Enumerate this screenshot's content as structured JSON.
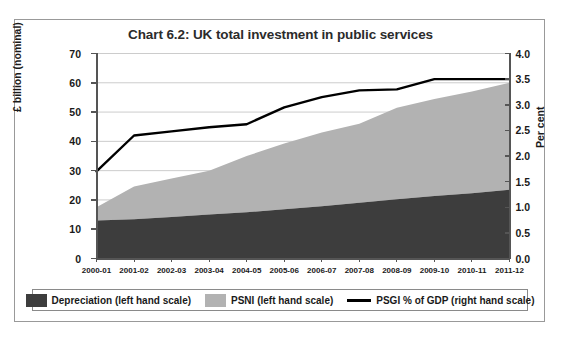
{
  "chart_data": {
    "type": "area",
    "title": "Chart 6.2: UK total investment in public services",
    "xlabel": "Years",
    "ylabel": "£ billion (nominal)",
    "ylabel_right": "Per cent",
    "categories": [
      "2000-01",
      "2001-02",
      "2002-03",
      "2003-04",
      "2004-05",
      "2005-06",
      "2006-07",
      "2007-08",
      "2008-09",
      "2009-10",
      "2010-11",
      "2011-12"
    ],
    "ylim": [
      0,
      70
    ],
    "yticks": [
      "0",
      "10",
      "20",
      "30",
      "40",
      "50",
      "60",
      "70"
    ],
    "ylim_right": [
      0,
      4.0
    ],
    "yticks_right": [
      "0.0",
      "0.5",
      "1.0",
      "1.5",
      "2.0",
      "2.5",
      "3.0",
      "3.5",
      "4.0"
    ],
    "grid": true,
    "legend_position": "bottom",
    "series": [
      {
        "name": "Depreciation (left hand scale)",
        "type": "area-stacked",
        "axis": "left",
        "color": "#3d3d3d",
        "values": [
          13.0,
          13.4,
          14.2,
          15.0,
          15.8,
          16.8,
          17.8,
          19.0,
          20.2,
          21.3,
          22.3,
          23.5
        ]
      },
      {
        "name": "PSNI (left hand scale)",
        "type": "area-stacked",
        "axis": "left",
        "color": "#b2b2b2",
        "values": [
          4.5,
          11.2,
          13.1,
          15.0,
          19.2,
          22.5,
          25.2,
          27.0,
          31.3,
          33.2,
          34.7,
          36.5
        ]
      },
      {
        "name": "PSGI % of GDP (right hand scale)",
        "type": "line",
        "axis": "right",
        "color": "#000000",
        "values": [
          1.7,
          2.4,
          2.48,
          2.56,
          2.62,
          2.95,
          3.15,
          3.28,
          3.3,
          3.5,
          3.5,
          3.5
        ]
      }
    ],
    "totals_left_scale": [
      17.5,
      24.6,
      27.3,
      30.0,
      35.0,
      39.3,
      43.0,
      46.0,
      51.5,
      54.5,
      57.0,
      60.0
    ]
  },
  "legend": {
    "items": [
      {
        "label": "Depreciation (left hand scale)",
        "marker": "swatch",
        "color": "#3d3d3d"
      },
      {
        "label": "PSNI (left hand scale)",
        "marker": "swatch",
        "color": "#b2b2b2"
      },
      {
        "label": "PSGI % of GDP (right hand scale)",
        "marker": "line",
        "color": "#000000"
      }
    ]
  },
  "colors": {
    "depreciation": "#3d3d3d",
    "psni": "#b2b2b2",
    "psgi_line": "#000000",
    "axis": "#555555",
    "grid": "#cccccc",
    "frame": "#999999"
  }
}
